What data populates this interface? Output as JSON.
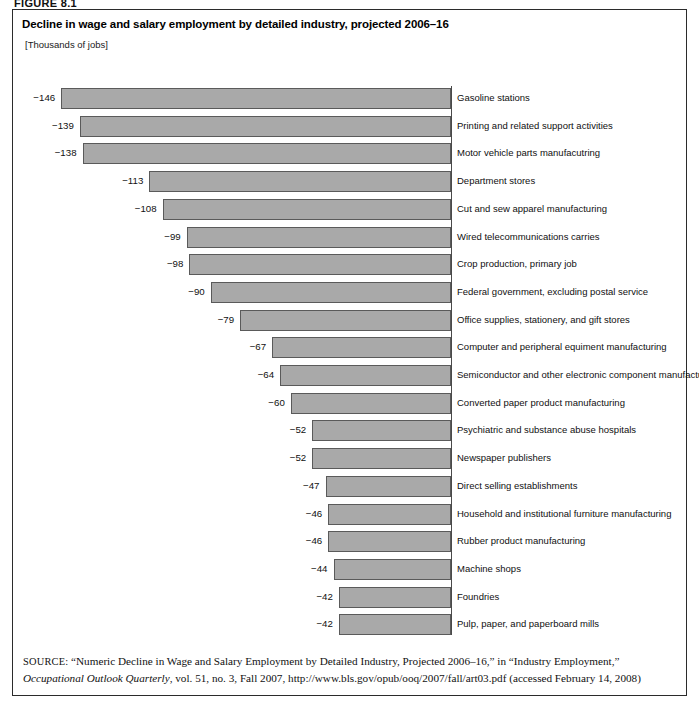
{
  "figure": {
    "label": "FIGURE 8.1"
  },
  "chart_title": "Decline in wage and salary employment by detailed industry, projected 2006–16",
  "chart_units": "[Thousands of jobs]",
  "source": {
    "keyword": "SOURCE:",
    "text_part1": " “Numeric Decline in Wage and Salary Employment by Detailed Industry, Projected 2006–16,” in “Industry Employment,” ",
    "italic1": "Occupational Outlook Quarterly",
    "text_part2": ", vol. 51, no. 3, Fall 2007, http://www.bls.gov/opub/ooq/2007/fall/art03.pdf (accessed February 14, 2008)"
  },
  "chart_data": {
    "type": "bar",
    "orientation": "horizontal",
    "title": "Decline in wage and salary employment by detailed industry, projected 2006–16",
    "subtitle": "[Thousands of jobs]",
    "xlabel": "",
    "ylabel": "",
    "units": "Thousands of jobs",
    "grid": false,
    "legend": "none",
    "xlim": [
      -150,
      0
    ],
    "categories": [
      "Gasoline stations",
      "Printing and related support activities",
      "Motor vehicle parts manufacutring",
      "Department stores",
      "Cut and sew apparel manufacturing",
      "Wired telecommunications carries",
      "Crop production, primary job",
      "Federal government, excluding postal service",
      "Office supplies, stationery, and gift stores",
      "Computer and peripheral equiment manufacturing",
      "Semiconductor and other electronic component manufacturing",
      "Converted paper product manufacturing",
      "Psychiatric and substance abuse hospitals",
      "Newspaper publishers",
      "Direct selling establishments",
      "Household and institutional furniture manufacturing",
      "Rubber product manufacturing",
      "Machine shops",
      "Foundries",
      "Pulp, paper, and paperboard mills"
    ],
    "values": [
      -146,
      -139,
      -138,
      -113,
      -108,
      -99,
      -98,
      -90,
      -79,
      -67,
      -64,
      -60,
      -52,
      -52,
      -47,
      -46,
      -46,
      -44,
      -42,
      -42
    ],
    "value_labels": [
      "−146",
      "−139",
      "−138",
      "−113",
      "−108",
      "−99",
      "−98",
      "−90",
      "−79",
      "−67",
      "−64",
      "−60",
      "−52",
      "−52",
      "−47",
      "−46",
      "−46",
      "−44",
      "−42",
      "−42"
    ],
    "bar_color": "#a9a9a9",
    "bar_border_color": "#5a5a5a"
  }
}
